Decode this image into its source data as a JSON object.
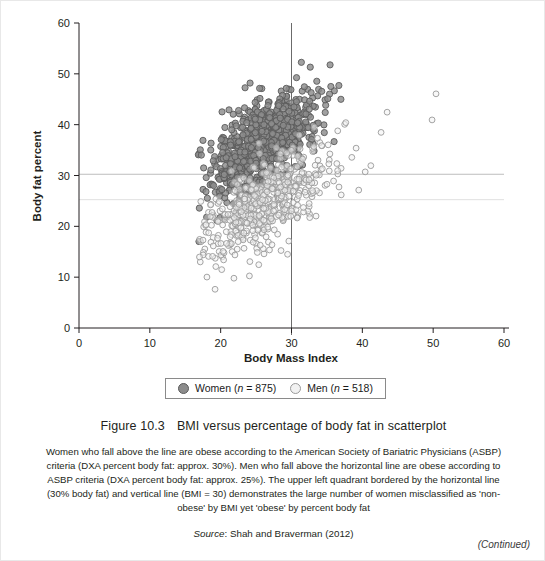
{
  "figure": {
    "number": "Figure 10.3",
    "title": "BMI versus percentage of body fat in scatterplot",
    "note": "Women who fall above the line are obese according to the American Society of Bariatric Physicians (ASBP) criteria (DXA percent body fat: approx. 30%). Men who fall above the horizontal line are obese according to ASBP criteria (DXA percent body fat: approx. 25%). The upper left quadrant bordered by the horizontal line (30% body fat) and vertical line (BMI = 30) demonstrates the large number of women misclassified as 'non-obese' by BMI yet 'obese' by percent body fat",
    "source_word": "Source",
    "source_text": ": Shah and Braverman (2012)",
    "continued": "(Continued)"
  },
  "legend": {
    "items": [
      {
        "label": "Women (",
        "italic": "n",
        "suffix": " = 875)",
        "marker": "filled-circle",
        "color": "#8c8c8c"
      },
      {
        "label": "Men (",
        "italic": "n",
        "suffix": " = 518)",
        "marker": "open-circle",
        "color": "#f2f2f2"
      }
    ]
  },
  "chart_data": {
    "type": "scatter",
    "title": "BMI versus percentage of body fat in scatterplot",
    "xlabel": "Body Mass Index",
    "ylabel": "Body fat percent",
    "xlim": [
      0,
      60
    ],
    "ylim": [
      0,
      60
    ],
    "xticks": [
      0,
      10,
      20,
      30,
      40,
      50,
      60
    ],
    "yticks": [
      0,
      10,
      20,
      30,
      40,
      50,
      60
    ],
    "grid": false,
    "legend_position": "below-axes",
    "reference_lines": [
      {
        "orientation": "horizontal",
        "value": 30,
        "label": "30% body fat (ASBP women obese cutoff)",
        "color": "#bdbdbd"
      },
      {
        "orientation": "horizontal",
        "value": 25,
        "label": "25% body fat (ASBP men obese cutoff)",
        "color": "#dcdcdc"
      },
      {
        "orientation": "vertical",
        "value": 30,
        "label": "BMI = 30",
        "color": "#6b6b6b"
      }
    ],
    "series": [
      {
        "name": "Women (n = 875)",
        "n": 875,
        "marker": "filled-circle",
        "color": "#8c8c8c",
        "edge": "#5a5a5a",
        "x_range": [
          16.5,
          47.5
        ],
        "y_range": [
          14.0,
          55.5
        ],
        "x_mean": 25.8,
        "y_mean": 35.5,
        "description": "Dense cloud centred near BMI 24-28 and 32-42% body fat, rising with BMI; the bulk sits left of BMI 30 and above 30% body fat."
      },
      {
        "name": "Men (n = 518)",
        "n": 518,
        "marker": "open-circle",
        "color": "#f2f2f2",
        "edge": "#9a9a9a",
        "x_range": [
          17.0,
          54.5
        ],
        "y_range": [
          6.5,
          49.5
        ],
        "x_mean": 26.6,
        "y_mean": 24.5,
        "description": "Lower, broader cloud centred near BMI 25-29 and 20-28% body fat; long right tail of sparse points out to BMI 54."
      }
    ]
  }
}
